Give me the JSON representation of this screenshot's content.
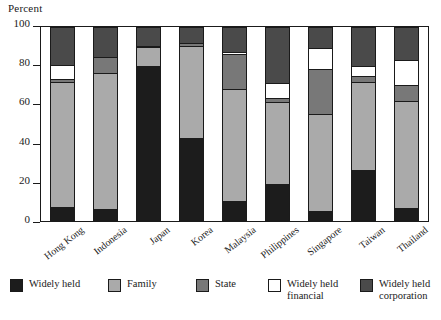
{
  "chart_data": {
    "type": "bar",
    "subtype": "stacked-vertical-100",
    "title": "",
    "xlabel": "",
    "ylabel": "Percent",
    "ylim": [
      0,
      100
    ],
    "yticks": [
      0,
      20,
      40,
      60,
      80,
      100
    ],
    "grid": false,
    "legend_position": "bottom",
    "categories": [
      "Hong Kong",
      "Indonesia",
      "Japan",
      "Korea",
      "Malaysia",
      "Philippines",
      "Singapore",
      "Taiwan",
      "Thailand"
    ],
    "series": [
      {
        "name": "Widely held",
        "color": "#1c1c1c",
        "values": [
          7.0,
          6.0,
          79.8,
          43.0,
          10.3,
          19.2,
          5.4,
          26.2,
          6.6
        ]
      },
      {
        "name": "Family",
        "color": "#aaaaaa",
        "values": [
          64.7,
          70.4,
          9.7,
          47.2,
          57.5,
          42.1,
          49.7,
          45.5,
          55.3
        ]
      },
      {
        "name": "State",
        "color": "#787878",
        "values": [
          1.4,
          8.2,
          0.8,
          1.6,
          18.2,
          2.1,
          23.5,
          3.0,
          8.2
        ]
      },
      {
        "name": "Widely held financial",
        "color": "#ffffff",
        "values": [
          7.1,
          0.0,
          0.0,
          0.0,
          1.1,
          7.5,
          10.8,
          5.3,
          12.8
        ]
      },
      {
        "name": "Widely held corporation",
        "color": "#4a4a4a",
        "values": [
          19.8,
          15.4,
          9.7,
          8.2,
          12.9,
          29.1,
          10.6,
          20.0,
          17.1
        ]
      }
    ]
  }
}
